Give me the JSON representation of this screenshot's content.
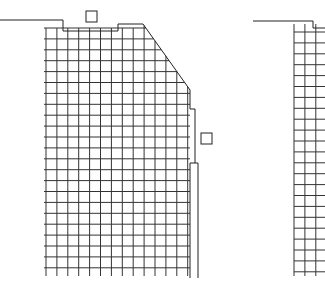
{
  "drawing": {
    "type": "building-elevation-line-drawing",
    "width": 325,
    "height": 289,
    "stroke_color": "#222222",
    "grid_color": "#333333",
    "background": "#ffffff",
    "facade_left": {
      "grid_x_start": 46,
      "grid_x_end": 198,
      "grid_y_start": 28,
      "grid_y_end": 276,
      "cell_size": 10.9,
      "columns": 14,
      "rows": 23,
      "roof_outline": [
        [
          0,
          20
        ],
        [
          63,
          20
        ],
        [
          63,
          31
        ],
        [
          118,
          31
        ],
        [
          118,
          24
        ],
        [
          143,
          24
        ],
        [
          190,
          90
        ],
        [
          190,
          278
        ]
      ],
      "chamfer": [
        [
          143,
          24
        ],
        [
          190,
          90
        ]
      ],
      "bay_outline": [
        [
          190,
          109
        ],
        [
          195,
          109
        ],
        [
          195,
          163
        ],
        [
          190,
          163
        ]
      ],
      "small_squares": [
        {
          "x": 86,
          "y": 11,
          "w": 11,
          "h": 11
        },
        {
          "x": 201,
          "y": 133,
          "w": 11,
          "h": 11
        }
      ]
    },
    "facade_right": {
      "grid_x_start": 294,
      "grid_x_end": 325,
      "grid_y_start": 24,
      "grid_y_end": 276,
      "cell_size": 10.9,
      "roof_outline": [
        [
          253,
          21
        ],
        [
          313,
          21
        ],
        [
          313,
          28
        ],
        [
          325,
          28
        ]
      ]
    }
  }
}
